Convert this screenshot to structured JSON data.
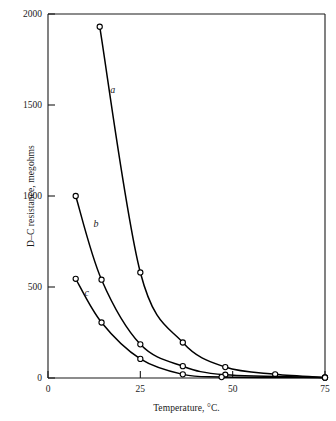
{
  "chart_data": {
    "type": "line",
    "title": "",
    "xlabel": "Temperature, °C.",
    "ylabel": "D–C resistance, megohms",
    "xlim": [
      0,
      75
    ],
    "ylim": [
      0,
      2000
    ],
    "xticks": [
      0,
      25,
      50,
      75
    ],
    "xticklabels": [
      "0",
      "25",
      "50",
      "75"
    ],
    "yticks": [
      0,
      500,
      1000,
      1500,
      2000
    ],
    "yticklabels": [
      "0",
      "500",
      "1000",
      "1500",
      "2000"
    ],
    "grid": false,
    "legend": "inline-curve-labels",
    "marker": "open-circle",
    "line_color": "#000000",
    "series": [
      {
        "name": "a",
        "label": "a",
        "label_x": 17.5,
        "label_y": 1565,
        "points": [
          {
            "x": 14.0,
            "y": 1930
          },
          {
            "x": 25.0,
            "y": 580
          },
          {
            "x": 36.5,
            "y": 195
          },
          {
            "x": 48.0,
            "y": 60
          },
          {
            "x": 61.5,
            "y": 20
          },
          {
            "x": 75.0,
            "y": 3
          }
        ]
      },
      {
        "name": "b",
        "label": "b",
        "label_x": 13.0,
        "label_y": 830,
        "points": [
          {
            "x": 7.5,
            "y": 1000
          },
          {
            "x": 14.5,
            "y": 540
          },
          {
            "x": 25.0,
            "y": 185
          },
          {
            "x": 36.5,
            "y": 65
          },
          {
            "x": 48.0,
            "y": 18
          },
          {
            "x": 75.0,
            "y": 3
          }
        ]
      },
      {
        "name": "c",
        "label": "c",
        "label_x": 10.5,
        "label_y": 450,
        "points": [
          {
            "x": 7.5,
            "y": 545
          },
          {
            "x": 14.5,
            "y": 305
          },
          {
            "x": 25.0,
            "y": 105
          },
          {
            "x": 36.5,
            "y": 20
          },
          {
            "x": 47.0,
            "y": 5
          },
          {
            "x": 75.0,
            "y": 2
          }
        ]
      }
    ]
  }
}
